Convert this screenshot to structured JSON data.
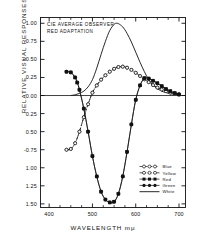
{
  "chart_data": {
    "type": "line",
    "title": "",
    "annotation_lines": [
      "CIE AVERAGE OBSERVER",
      "RED ADAPTATION"
    ],
    "xlabel": "WAVELENGTH mμ",
    "ylabel": "RELATIVE VISUAL RESPONSES",
    "xlim": [
      380,
      715
    ],
    "ylim": [
      -1.55,
      1.08
    ],
    "grid": false,
    "legend_position": "lower-right",
    "xticks": [
      400,
      500,
      600,
      700
    ],
    "xticklabels": [
      "400",
      "500",
      "600",
      "700"
    ],
    "xminor": [
      425,
      450,
      475,
      525,
      550,
      575,
      625,
      650,
      675
    ],
    "yticks": [
      1.0,
      0.75,
      0.5,
      0.25,
      0.0,
      -0.25,
      -0.5,
      -0.75,
      -1.0,
      -1.25,
      -1.5
    ],
    "yticklabels": [
      "1.00",
      "0.75",
      "+0.50",
      "0.25",
      "0.00",
      "0.25",
      "0.50",
      "-0.75",
      "1.00",
      "1.25",
      "1.50"
    ],
    "zero_line": 0.0,
    "series": [
      {
        "name": "Blue",
        "marker": "open-circle",
        "line": "dashed",
        "x": [
          440,
          450,
          460,
          470,
          480,
          490,
          500,
          510,
          520,
          530,
          540,
          550,
          560,
          570,
          580,
          590,
          600,
          610,
          620,
          630,
          640,
          650,
          660,
          670,
          680,
          690,
          700
        ],
        "values": [
          -0.75,
          -0.74,
          -0.66,
          -0.5,
          -0.3,
          -0.12,
          0.04,
          0.14,
          0.22,
          0.28,
          0.33,
          0.37,
          0.395,
          0.4,
          0.385,
          0.355,
          0.315,
          0.27,
          0.225,
          0.185,
          0.145,
          0.11,
          0.085,
          0.06,
          0.04,
          0.025,
          0.015
        ]
      },
      {
        "name": "Yellow",
        "marker": "open-circle",
        "line": "dash-dot",
        "x": [
          440,
          450,
          460,
          470,
          480,
          490,
          500,
          510,
          520,
          530,
          540,
          550,
          560,
          570,
          580,
          590,
          600,
          610,
          620,
          630,
          640,
          650,
          660,
          670,
          680,
          690,
          700
        ],
        "values": [
          -0.75,
          -0.74,
          -0.66,
          -0.5,
          -0.3,
          -0.12,
          0.04,
          0.14,
          0.22,
          0.28,
          0.33,
          0.37,
          0.395,
          0.4,
          0.385,
          0.355,
          0.315,
          0.27,
          0.225,
          0.185,
          0.145,
          0.11,
          0.085,
          0.06,
          0.04,
          0.025,
          0.015
        ]
      },
      {
        "name": "Red",
        "marker": "filled-square",
        "line": "solid",
        "x": [
          440,
          450,
          460,
          465,
          470,
          480,
          490,
          500,
          510,
          520,
          530,
          540,
          550,
          560,
          570,
          580,
          590,
          600,
          610,
          620,
          630,
          640,
          650,
          660,
          670,
          680,
          690,
          700
        ],
        "values": [
          0.33,
          0.32,
          0.25,
          0.18,
          0.08,
          -0.18,
          -0.5,
          -0.84,
          -1.12,
          -1.33,
          -1.44,
          -1.48,
          -1.47,
          -1.36,
          -1.12,
          -0.78,
          -0.4,
          -0.06,
          0.14,
          0.24,
          0.235,
          0.205,
          0.17,
          0.13,
          0.09,
          0.06,
          0.035,
          0.015
        ]
      },
      {
        "name": "Green",
        "marker": "filled-circle",
        "line": "solid",
        "x": [
          440,
          450,
          460,
          465,
          470,
          480,
          490,
          500,
          510,
          520,
          530,
          540,
          550,
          560,
          570,
          580,
          590,
          600,
          610,
          620,
          630,
          640,
          650,
          660,
          670,
          680,
          690,
          700
        ],
        "values": [
          0.33,
          0.32,
          0.25,
          0.18,
          0.08,
          -0.18,
          -0.5,
          -0.84,
          -1.12,
          -1.33,
          -1.44,
          -1.48,
          -1.47,
          -1.36,
          -1.12,
          -0.78,
          -0.4,
          -0.06,
          0.14,
          0.24,
          0.235,
          0.205,
          0.17,
          0.13,
          0.09,
          0.06,
          0.035,
          0.015
        ]
      },
      {
        "name": "White",
        "marker": "none",
        "line": "solid",
        "x": [
          450,
          460,
          470,
          480,
          490,
          500,
          510,
          520,
          530,
          540,
          550,
          555,
          560,
          570,
          580,
          590,
          600,
          610,
          620,
          630,
          640,
          650,
          660,
          670,
          680,
          690,
          700
        ],
        "values": [
          0.0,
          0.01,
          0.03,
          0.06,
          0.12,
          0.22,
          0.38,
          0.57,
          0.75,
          0.9,
          0.985,
          1.0,
          0.995,
          0.95,
          0.86,
          0.74,
          0.6,
          0.46,
          0.33,
          0.22,
          0.145,
          0.095,
          0.06,
          0.04,
          0.025,
          0.018,
          0.012
        ]
      }
    ]
  },
  "legend": {
    "items": [
      {
        "label": "Blue"
      },
      {
        "label": "Yellow"
      },
      {
        "label": "Red"
      },
      {
        "label": "Green"
      },
      {
        "label": "White"
      }
    ]
  },
  "colors": {
    "ink": "#111111",
    "background": "#ffffff"
  }
}
